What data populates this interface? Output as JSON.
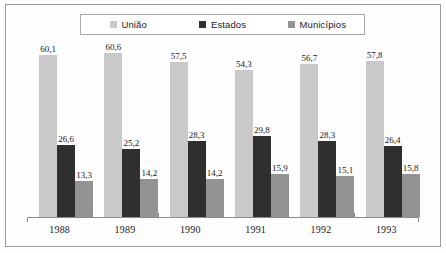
{
  "chart_data": {
    "type": "bar",
    "title": "",
    "subtitle": "",
    "xlabel": "",
    "ylabel": "",
    "categories": [
      "1988",
      "1989",
      "1990",
      "1991",
      "1992",
      "1993"
    ],
    "series": [
      {
        "name": "União",
        "color": "#c9c9c9",
        "values": [
          60.1,
          60.6,
          57.5,
          54.3,
          56.7,
          57.8
        ],
        "labels": [
          "60,1",
          "60,6",
          "57,5",
          "54,3",
          "56,7",
          "57,8"
        ]
      },
      {
        "name": "Estados",
        "color": "#2f2f2f",
        "values": [
          26.6,
          25.2,
          28.3,
          29.8,
          28.3,
          26.4
        ],
        "labels": [
          "26,6",
          "25,2",
          "28,3",
          "29,8",
          "28,3",
          "26,4"
        ]
      },
      {
        "name": "Municípios",
        "color": "#939393",
        "values": [
          13.3,
          14.2,
          14.2,
          15.9,
          15.1,
          15.8
        ],
        "labels": [
          "13,3",
          "14,2",
          "14,2",
          "15,9",
          "15,1",
          "15,8"
        ]
      }
    ],
    "ylim": [
      0,
      64
    ],
    "grid": false,
    "legend_position": "top"
  },
  "legend": {
    "entries": [
      {
        "label": "União",
        "swatch": "#c9c9c9"
      },
      {
        "label": "Estados",
        "swatch": "#2f2f2f"
      },
      {
        "label": "Municípios",
        "swatch": "#939393"
      }
    ]
  }
}
